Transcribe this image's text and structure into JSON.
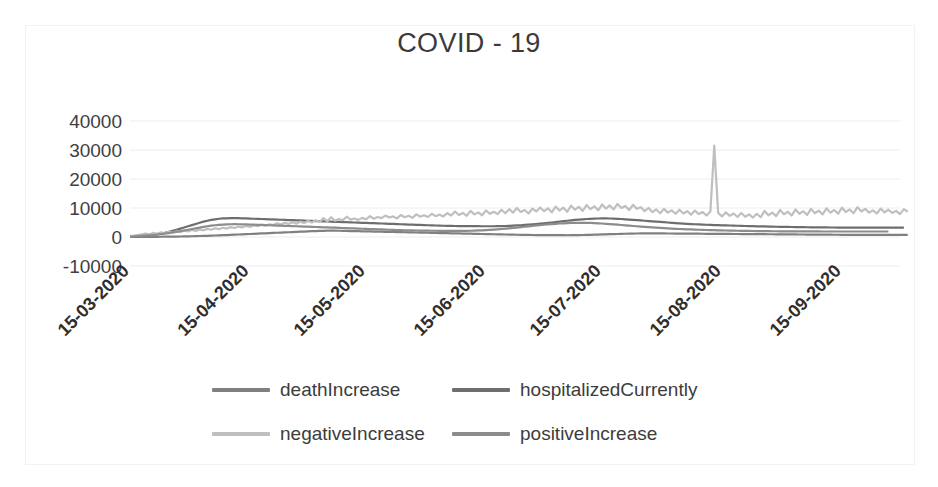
{
  "chart_data": {
    "type": "line",
    "title": "COVID - 19",
    "xlabel": "",
    "ylabel": "",
    "ylim": [
      -10000,
      40000
    ],
    "ytick_labels": [
      "40000",
      "30000",
      "20000",
      "10000",
      "0",
      "-10000"
    ],
    "yticks": [
      40000,
      30000,
      20000,
      10000,
      0,
      -10000
    ],
    "grid": true,
    "legend_position": "bottom",
    "x_tick_labels": [
      "15-03-2020",
      "15-04-2020",
      "15-05-2020",
      "15-06-2020",
      "15-07-2020",
      "15-08-2020",
      "15-09-2020"
    ],
    "x_tick_index": [
      0,
      31,
      61,
      92,
      122,
      153,
      184
    ],
    "x_range_start": "15-03-2020",
    "x_range_end": "30-09-2020",
    "n_points": 200,
    "series": [
      {
        "name": "deathIncrease",
        "color": "#808080",
        "values": [
          12,
          20,
          25,
          33,
          40,
          48,
          57,
          68,
          80,
          95,
          110,
          130,
          150,
          175,
          200,
          230,
          265,
          300,
          340,
          380,
          420,
          470,
          520,
          570,
          620,
          680,
          740,
          800,
          860,
          920,
          980,
          1040,
          1100,
          1160,
          1220,
          1280,
          1340,
          1400,
          1460,
          1520,
          1580,
          1640,
          1700,
          1760,
          1820,
          1880,
          1940,
          2000,
          2060,
          2100,
          2140,
          2180,
          2200,
          2180,
          2150,
          2120,
          2090,
          2060,
          2030,
          2000,
          1970,
          1940,
          1910,
          1880,
          1850,
          1820,
          1790,
          1760,
          1730,
          1700,
          1670,
          1640,
          1610,
          1580,
          1550,
          1520,
          1490,
          1460,
          1430,
          1400,
          1370,
          1340,
          1310,
          1280,
          1250,
          1220,
          1190,
          1160,
          1130,
          1100,
          1070,
          1040,
          1010,
          980,
          950,
          920,
          890,
          860,
          830,
          800,
          770,
          740,
          720,
          700,
          690,
          680,
          670,
          660,
          650,
          640,
          630,
          620,
          615,
          610,
          620,
          640,
          660,
          690,
          720,
          760,
          800,
          840,
          880,
          920,
          960,
          1000,
          1040,
          1080,
          1120,
          1160,
          1190,
          1210,
          1230,
          1240,
          1250,
          1245,
          1240,
          1230,
          1220,
          1210,
          1200,
          1190,
          1180,
          1170,
          1160,
          1150,
          1140,
          1130,
          1120,
          1110,
          1100,
          1090,
          1080,
          1070,
          1060,
          1050,
          1040,
          1030,
          1020,
          1010,
          1000,
          990,
          980,
          970,
          960,
          950,
          940,
          930,
          920,
          910,
          900,
          890,
          880,
          870,
          860,
          850,
          840,
          830,
          820,
          810,
          800,
          790,
          780,
          770,
          760,
          750,
          745,
          740,
          735,
          730,
          725,
          720,
          715,
          710,
          705,
          700,
          700,
          700,
          700,
          700,
          700,
          700
        ]
      },
      {
        "name": "hospitalizedCurrently",
        "color": "#6e6e6e",
        "values": [
          200,
          260,
          330,
          420,
          520,
          650,
          800,
          980,
          1200,
          1450,
          1750,
          2100,
          2500,
          2900,
          3300,
          3700,
          4100,
          4500,
          4900,
          5300,
          5600,
          5900,
          6100,
          6300,
          6400,
          6450,
          6480,
          6500,
          6480,
          6450,
          6400,
          6350,
          6300,
          6250,
          6200,
          6150,
          6100,
          6050,
          6000,
          5950,
          5900,
          5850,
          5800,
          5750,
          5700,
          5650,
          5600,
          5550,
          5500,
          5450,
          5400,
          5350,
          5300,
          5250,
          5200,
          5150,
          5100,
          5050,
          5000,
          4950,
          4900,
          4850,
          4800,
          4750,
          4700,
          4650,
          4600,
          4550,
          4500,
          4450,
          4400,
          4350,
          4300,
          4250,
          4200,
          4150,
          4100,
          4050,
          4000,
          3960,
          3920,
          3880,
          3850,
          3820,
          3800,
          3780,
          3760,
          3750,
          3740,
          3730,
          3720,
          3710,
          3700,
          3700,
          3710,
          3730,
          3760,
          3800,
          3850,
          3910,
          3980,
          4060,
          4150,
          4250,
          4360,
          4480,
          4600,
          4730,
          4860,
          5000,
          5150,
          5300,
          5450,
          5600,
          5750,
          5900,
          6000,
          6100,
          6200,
          6280,
          6340,
          6380,
          6400,
          6400,
          6380,
          6340,
          6280,
          6200,
          6100,
          6000,
          5900,
          5800,
          5700,
          5600,
          5500,
          5400,
          5300,
          5200,
          5100,
          5000,
          4900,
          4800,
          4700,
          4620,
          4540,
          4460,
          4400,
          4340,
          4280,
          4220,
          4170,
          4120,
          4080,
          4040,
          4000,
          3960,
          3920,
          3880,
          3840,
          3800,
          3760,
          3720,
          3690,
          3660,
          3630,
          3600,
          3570,
          3540,
          3510,
          3490,
          3470,
          3450,
          3430,
          3410,
          3390,
          3370,
          3350,
          3330,
          3310,
          3300,
          3290,
          3280,
          3270,
          3260,
          3250,
          3245,
          3240,
          3235,
          3230,
          3225,
          3220,
          3215,
          3210,
          3205,
          3200,
          3200,
          3200,
          3200,
          3200,
          3200,
          3200
        ]
      },
      {
        "name": "negativeIncrease",
        "color": "#bfbfbf",
        "values": [
          300,
          450,
          700,
          900,
          1200,
          900,
          1400,
          1100,
          1600,
          1300,
          1800,
          1500,
          2000,
          1700,
          2200,
          1900,
          2400,
          2100,
          2600,
          2300,
          2800,
          2500,
          3000,
          2700,
          3200,
          2900,
          3400,
          3100,
          3600,
          3300,
          3800,
          3500,
          4000,
          3700,
          4200,
          3900,
          4400,
          4100,
          4700,
          4300,
          4900,
          4500,
          5100,
          4600,
          5300,
          4800,
          5500,
          5000,
          5800,
          5200,
          6500,
          5400,
          6800,
          5600,
          6200,
          5800,
          7000,
          6000,
          6400,
          5900,
          6600,
          6100,
          7200,
          6300,
          6900,
          6500,
          7400,
          6700,
          7100,
          6400,
          7600,
          6800,
          7300,
          6600,
          7800,
          7000,
          7500,
          6900,
          8000,
          7200,
          7700,
          7100,
          8200,
          7400,
          8800,
          7600,
          8300,
          7300,
          9000,
          7800,
          8500,
          7500,
          9200,
          8000,
          8700,
          7900,
          9400,
          8200,
          9600,
          8400,
          10000,
          8600,
          9300,
          8100,
          9800,
          8800,
          10200,
          8900,
          9900,
          8500,
          10500,
          9100,
          10100,
          8700,
          10800,
          9400,
          10400,
          9000,
          11000,
          9600,
          10600,
          9200,
          11200,
          9800,
          10900,
          9500,
          11400,
          10000,
          10700,
          9300,
          11100,
          9700,
          10300,
          8900,
          10000,
          8600,
          9500,
          8200,
          9700,
          8400,
          9200,
          8000,
          9400,
          8100,
          8900,
          7700,
          9100,
          7900,
          8600,
          7400,
          8800,
          31500,
          8300,
          7100,
          8500,
          7300,
          8100,
          6900,
          8300,
          7000,
          7800,
          6700,
          8000,
          6800,
          9000,
          7500,
          8400,
          7200,
          9300,
          7800,
          8700,
          7400,
          9500,
          8000,
          8900,
          7600,
          9700,
          8200,
          9100,
          7800,
          9900,
          8400,
          9300,
          8000,
          10100,
          8600,
          9500,
          8200,
          10300,
          8800,
          9700,
          8400,
          9200,
          8100,
          9800,
          8500,
          9400,
          8300,
          9000,
          7900,
          9600,
          8700
        ]
      },
      {
        "name": "positiveIncrease",
        "color": "#8c8c8c",
        "values": [
          150,
          200,
          280,
          360,
          450,
          560,
          680,
          820,
          980,
          1150,
          1350,
          1550,
          1780,
          2000,
          2250,
          2500,
          2750,
          3000,
          3250,
          3500,
          3700,
          3900,
          4050,
          4200,
          4300,
          4350,
          4400,
          4420,
          4400,
          4380,
          4350,
          4300,
          4250,
          4200,
          4150,
          4100,
          4050,
          4000,
          3950,
          3900,
          3850,
          3800,
          3750,
          3700,
          3650,
          3600,
          3550,
          3500,
          3450,
          3400,
          3350,
          3300,
          3250,
          3200,
          3150,
          3100,
          3050,
          3000,
          2950,
          2900,
          2850,
          2800,
          2750,
          2700,
          2650,
          2600,
          2550,
          2500,
          2450,
          2400,
          2350,
          2300,
          2280,
          2260,
          2240,
          2220,
          2200,
          2180,
          2160,
          2150,
          2140,
          2130,
          2120,
          2110,
          2100,
          2100,
          2110,
          2130,
          2160,
          2200,
          2250,
          2310,
          2380,
          2460,
          2550,
          2650,
          2760,
          2880,
          3000,
          3130,
          3260,
          3400,
          3540,
          3680,
          3820,
          3960,
          4100,
          4230,
          4350,
          4460,
          4560,
          4650,
          4730,
          4800,
          4850,
          4880,
          4900,
          4900,
          4880,
          4850,
          4800,
          4730,
          4650,
          4560,
          4460,
          4350,
          4240,
          4130,
          4020,
          3910,
          3800,
          3700,
          3600,
          3500,
          3400,
          3300,
          3210,
          3120,
          3040,
          2960,
          2890,
          2820,
          2760,
          2700,
          2650,
          2600,
          2550,
          2500,
          2460,
          2420,
          2380,
          2340,
          2300,
          2270,
          2240,
          2210,
          2180,
          2150,
          2130,
          2110,
          2090,
          2070,
          2050,
          2030,
          2010,
          2000,
          1990,
          1980,
          1970,
          1960,
          1950,
          1945,
          1940,
          1935,
          1930,
          1925,
          1920,
          1915,
          1910,
          1905,
          1900,
          1900,
          1900,
          1900,
          1900,
          1900,
          1900,
          1900,
          1900,
          1900,
          1900,
          1900,
          1900,
          1900,
          1900,
          1900,
          1900
        ]
      }
    ]
  },
  "legend": {
    "rows": [
      [
        {
          "label": "deathIncrease",
          "color": "#808080"
        },
        {
          "label": "hospitalizedCurrently",
          "color": "#6e6e6e"
        }
      ],
      [
        {
          "label": "negativeIncrease",
          "color": "#bfbfbf"
        },
        {
          "label": "positiveIncrease",
          "color": "#8c8c8c"
        }
      ]
    ]
  }
}
